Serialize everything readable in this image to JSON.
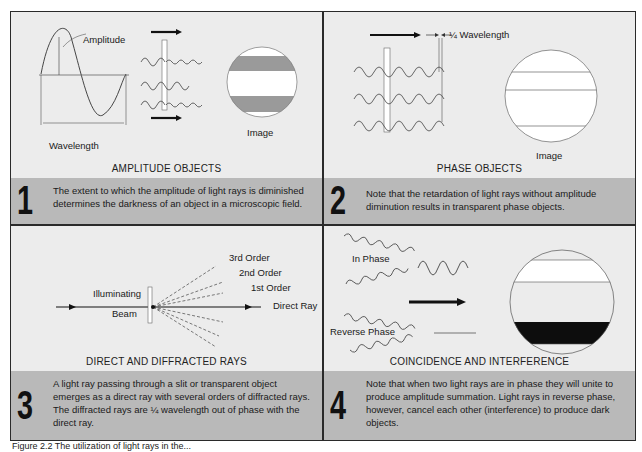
{
  "panels": [
    {
      "number": "1",
      "title": "AMPLITUDE OBJECTS",
      "description": "The extent to which the amplitude of light rays is diminished determines the darkness of an object in a microscopic field.",
      "labels": {
        "amplitude": "Amplitude",
        "wavelength": "Wavelength",
        "image": "Image"
      }
    },
    {
      "number": "2",
      "title": "PHASE OBJECTS",
      "description": "Note that the retardation of light rays without amplitude diminution results in transparent phase objects.",
      "labels": {
        "quarter_wavelength": "¼ Wavelength",
        "image": "Image"
      }
    },
    {
      "number": "3",
      "title": "DIRECT AND DIFFRACTED RAYS",
      "description": "A light ray passing through a slit or transparent object emerges as a direct ray with several orders of diffracted rays. The diffracted rays are ¼ wavelength out of phase with the direct ray.",
      "labels": {
        "illuminating": "Illuminating",
        "beam": "Beam",
        "third_order": "3rd Order",
        "second_order": "2nd Order",
        "first_order": "1st Order",
        "direct_ray": "Direct Ray"
      }
    },
    {
      "number": "4",
      "title": "COINCIDENCE AND INTERFERENCE",
      "description": "Note that when two light rays are in phase they will unite to produce amplitude summation. Light rays in reverse phase, however, cancel each other (interference) to produce dark objects.",
      "labels": {
        "in_phase": "In Phase",
        "reverse_phase": "Reverse Phase"
      }
    }
  ],
  "figure_caption": "Figure 2.2   The utilization of light rays in the...",
  "colors": {
    "panel_bg": "#ececec",
    "band_bg": "#b9b9b9",
    "border": "#2a2a2a",
    "gray_band": "#9a9a9a",
    "dark_band": "#0d0d0d"
  }
}
